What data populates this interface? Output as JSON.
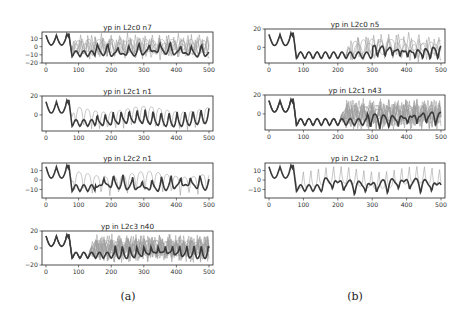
{
  "chart_data": [
    {
      "id": "a1",
      "type": "line",
      "title": "yp in L2c0 n7",
      "column": "a",
      "xlim": [
        0,
        500
      ],
      "xticks": [
        0,
        100,
        200,
        300,
        400,
        500
      ],
      "ylim": [
        -20,
        18
      ],
      "yticks": [
        10,
        0,
        -10,
        -20
      ],
      "ytick_labels": [
        "10",
        "0",
        "−10",
        "−20"
      ],
      "n_series": 7,
      "diverge_at": 70,
      "box": [
        42,
        32,
        213,
        63
      ]
    },
    {
      "id": "b1",
      "type": "line",
      "title": "yp in L2c0 n5",
      "column": "b",
      "xlim": [
        0,
        500
      ],
      "xticks": [
        0,
        100,
        200,
        300,
        400,
        500
      ],
      "ylim": [
        -17,
        20
      ],
      "yticks": [
        20,
        0
      ],
      "ytick_labels": [
        "20",
        "0"
      ],
      "n_series": 5,
      "diverge_at": 220,
      "box": [
        265,
        29,
        445,
        63
      ]
    },
    {
      "id": "a2",
      "type": "line",
      "title": "yp in L2c1 n1",
      "column": "a",
      "xlim": [
        0,
        500
      ],
      "xticks": [
        0,
        100,
        200,
        300,
        400,
        500
      ],
      "ylim": [
        -17,
        20
      ],
      "yticks": [
        20,
        0
      ],
      "ytick_labels": [
        "20",
        "0"
      ],
      "n_series": 2,
      "diverge_at": 70,
      "box": [
        42,
        96,
        213,
        131
      ]
    },
    {
      "id": "b2",
      "type": "line",
      "title": "yp in L2c1 n43",
      "column": "b",
      "xlim": [
        0,
        500
      ],
      "xticks": [
        0,
        100,
        200,
        300,
        400,
        500
      ],
      "ylim": [
        -17,
        20
      ],
      "yticks": [
        20,
        0
      ],
      "ytick_labels": [
        "20",
        "0"
      ],
      "n_series": 43,
      "diverge_at": 205,
      "box": [
        265,
        95,
        445,
        130
      ]
    },
    {
      "id": "a3",
      "type": "line",
      "title": "yp in L2c2 n1",
      "column": "a",
      "xlim": [
        0,
        500
      ],
      "xticks": [
        0,
        100,
        200,
        300,
        400,
        500
      ],
      "ylim": [
        -19,
        18
      ],
      "yticks": [
        10,
        0,
        -10
      ],
      "ytick_labels": [
        "10",
        "0",
        "−10"
      ],
      "n_series": 2,
      "diverge_at": 70,
      "box": [
        42,
        163,
        213,
        198
      ]
    },
    {
      "id": "b3",
      "type": "line",
      "title": "yp in L2c2 n1",
      "column": "b",
      "xlim": [
        0,
        500
      ],
      "xticks": [
        0,
        100,
        200,
        300,
        400,
        500
      ],
      "ylim": [
        -19,
        18
      ],
      "yticks": [
        10,
        0,
        -10
      ],
      "ytick_labels": [
        "10",
        "0",
        "−10"
      ],
      "n_series": 2,
      "diverge_at": 70,
      "box": [
        265,
        163,
        445,
        198
      ]
    },
    {
      "id": "a4",
      "type": "line",
      "title": "yp in L2c3 n40",
      "column": "a",
      "xlim": [
        0,
        500
      ],
      "xticks": [
        0,
        100,
        200,
        300,
        400,
        500
      ],
      "ylim": [
        -20,
        20
      ],
      "yticks": [
        20,
        0,
        -20
      ],
      "ytick_labels": [
        "20",
        "0",
        "−20"
      ],
      "n_series": 40,
      "diverge_at": 130,
      "box": [
        42,
        231,
        213,
        265
      ]
    }
  ],
  "captions": {
    "a": "(a)",
    "b": "(b)"
  },
  "colors": {
    "main_trace": "#3a3a3a",
    "other_traces": "#9a9a9a",
    "axes": "#222222"
  }
}
